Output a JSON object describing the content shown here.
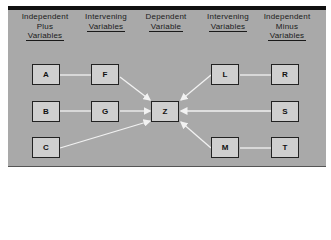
{
  "columns": [
    {
      "id": "independent-plus",
      "lines": [
        "Independent",
        "Plus"
      ],
      "underlined": "Variables"
    },
    {
      "id": "intervening-left",
      "lines": [
        "Intervening"
      ],
      "underlined": "Variables"
    },
    {
      "id": "dependent",
      "lines": [
        "Dependent"
      ],
      "underlined": "Variable"
    },
    {
      "id": "intervening-right",
      "lines": [
        "Intervening"
      ],
      "underlined": "Variables"
    },
    {
      "id": "independent-minus",
      "lines": [
        "Independent",
        "Minus"
      ],
      "underlined": "Variables"
    }
  ],
  "nodes": {
    "A": "A",
    "B": "B",
    "C": "C",
    "F": "F",
    "G": "G",
    "Z": "Z",
    "L": "L",
    "M": "M",
    "R": "R",
    "S": "S",
    "T": "T"
  },
  "edges": [
    {
      "from": "A",
      "to": "F",
      "arrow": false
    },
    {
      "from": "B",
      "to": "G",
      "arrow": false
    },
    {
      "from": "F",
      "to": "Z",
      "arrow": true
    },
    {
      "from": "G",
      "to": "Z",
      "arrow": true
    },
    {
      "from": "C",
      "to": "Z",
      "arrow": true
    },
    {
      "from": "R",
      "to": "L",
      "arrow": false
    },
    {
      "from": "T",
      "to": "M",
      "arrow": false
    },
    {
      "from": "L",
      "to": "Z",
      "arrow": true
    },
    {
      "from": "S",
      "to": "Z",
      "arrow": true
    },
    {
      "from": "M",
      "to": "Z",
      "arrow": true
    }
  ],
  "colors": {
    "panel": "#a9a9a9",
    "box": "#cfcfcf",
    "line": "#f2f2f2",
    "border": "#111111"
  }
}
